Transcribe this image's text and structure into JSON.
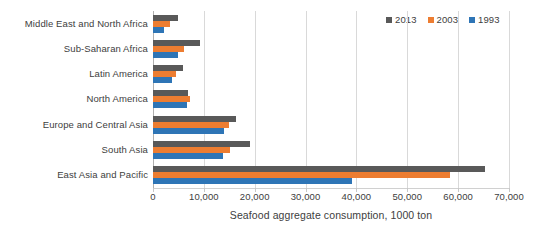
{
  "chart_data": {
    "type": "bar",
    "orientation": "horizontal",
    "title": "",
    "xlabel": "Seafood aggregate consumption, 1000 ton",
    "ylabel": "",
    "xlim": [
      0,
      70000
    ],
    "xticks": [
      0,
      10000,
      20000,
      30000,
      40000,
      50000,
      60000,
      70000
    ],
    "xtick_labels": [
      "0",
      "10,000",
      "20,000",
      "30,000",
      "40,000",
      "50,000",
      "60,000",
      "70,000"
    ],
    "grid": true,
    "legend_position": "top-right",
    "categories": [
      "Middle East and North Africa",
      "Sub-Saharan Africa",
      "Latin America",
      "North America",
      "Europe and Central Asia",
      "South Asia",
      "East Asia and Pacific"
    ],
    "series": [
      {
        "name": "2013",
        "color": "#595959",
        "values": [
          4900,
          9300,
          5900,
          6900,
          16300,
          19100,
          65300
        ]
      },
      {
        "name": "2003",
        "color": "#ED7D31",
        "values": [
          3400,
          6100,
          4500,
          7300,
          14900,
          15100,
          58400
        ]
      },
      {
        "name": "1993",
        "color": "#2E75B6",
        "values": [
          2100,
          4900,
          3700,
          6700,
          13900,
          13800,
          39100
        ]
      }
    ]
  },
  "legend": {
    "entries": [
      {
        "label": "2013",
        "color": "#595959"
      },
      {
        "label": "2003",
        "color": "#ED7D31"
      },
      {
        "label": "1993",
        "color": "#2E75B6"
      }
    ]
  },
  "axis": {
    "x_title": "Seafood aggregate consumption, 1000 ton"
  }
}
